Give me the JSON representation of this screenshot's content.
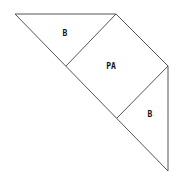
{
  "diagram": {
    "shape": "large right triangle subdivided into two triangles and a square",
    "regions": [
      {
        "id": "top-triangle",
        "label": "B",
        "points": "15,14 116,14 66,66",
        "label_pos": [
          65,
          36
        ]
      },
      {
        "id": "center-square",
        "label": "PA",
        "points": "116,14 168,66 117,118 66,66",
        "label_pos": [
          111,
          69
        ]
      },
      {
        "id": "right-triangle",
        "label": "B",
        "points": "168,66 168,171 117,118",
        "label_pos": [
          150,
          117
        ]
      }
    ],
    "outline": "15,14 116,14 168,66 168,171",
    "hypotenuse": "15,14 168,171",
    "colors": {
      "stroke": "#555555",
      "text": "#111111",
      "background": "#ffffff"
    }
  }
}
